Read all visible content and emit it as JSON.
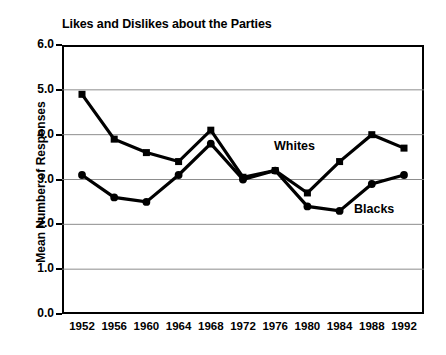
{
  "chart_data": {
    "type": "line",
    "title": "Likes and Dislikes about the Parties",
    "xlabel": "",
    "ylabel": "Mean Number of Responses",
    "categories": [
      "1952",
      "1956",
      "1960",
      "1964",
      "1968",
      "1972",
      "1976",
      "1980",
      "1984",
      "1988",
      "1992"
    ],
    "x": [
      1952,
      1956,
      1960,
      1964,
      1968,
      1972,
      1976,
      1980,
      1984,
      1988,
      1992
    ],
    "series": [
      {
        "name": "Whites",
        "marker": "square",
        "color": "#000000",
        "values": [
          4.9,
          3.9,
          3.6,
          3.4,
          4.1,
          3.05,
          3.2,
          2.7,
          3.4,
          4.0,
          3.7
        ]
      },
      {
        "name": "Blacks",
        "marker": "circle",
        "color": "#000000",
        "values": [
          3.1,
          2.6,
          2.5,
          3.1,
          3.8,
          3.0,
          3.2,
          2.4,
          2.3,
          2.9,
          3.1
        ]
      }
    ],
    "ylim": [
      0.0,
      6.0
    ],
    "ytick_labels": [
      "0.0",
      "1.0",
      "2.0",
      "3.0",
      "4.0",
      "5.0",
      "6.0"
    ],
    "yticks": [
      0.0,
      1.0,
      2.0,
      3.0,
      4.0,
      5.0,
      6.0
    ],
    "grid": true,
    "grid_axis": "y",
    "grid_color": "#808080",
    "legend_position": "inline-annotations",
    "annotations": [
      {
        "text": "Whites",
        "series": "Whites"
      },
      {
        "text": "Blacks",
        "series": "Blacks"
      }
    ]
  }
}
